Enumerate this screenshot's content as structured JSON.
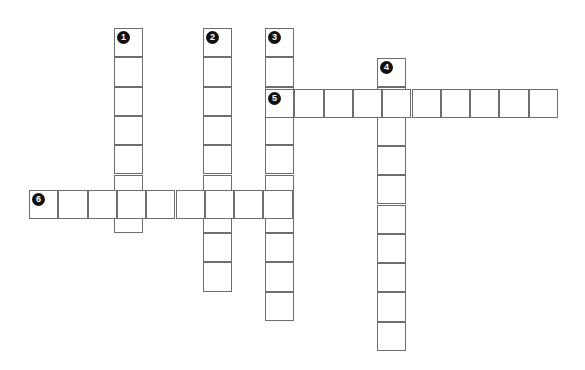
{
  "puzzle": {
    "title": "Crossword Puzzle Grid",
    "background_color": "#ffffff",
    "cell_border_color": "#6e6e6e",
    "number_badge_color": "#111111",
    "number_text_color": "#ffffff",
    "cell_size": 29.3,
    "entries": [
      {
        "number": "1",
        "direction": "down",
        "length": 7,
        "start_x": 114,
        "start_y": 28,
        "label": "1"
      },
      {
        "number": "2",
        "direction": "down",
        "length": 9,
        "start_x": 203,
        "start_y": 28,
        "label": "2"
      },
      {
        "number": "3",
        "direction": "down",
        "length": 10,
        "start_x": 265,
        "start_y": 28,
        "label": "3"
      },
      {
        "number": "4",
        "direction": "down",
        "length": 10,
        "start_x": 377,
        "start_y": 58,
        "label": "4"
      },
      {
        "number": "5",
        "direction": "across",
        "length": 10,
        "start_x": 265,
        "start_y": 89,
        "label": "5"
      },
      {
        "number": "6",
        "direction": "across",
        "length": 9,
        "start_x": 29,
        "start_y": 190,
        "label": "6"
      }
    ]
  }
}
